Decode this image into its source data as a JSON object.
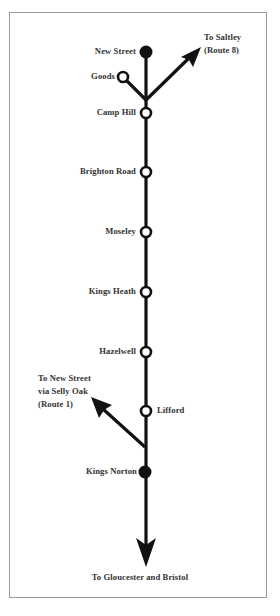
{
  "diagram": {
    "type": "railway-route-diagram",
    "line_color": "#111111",
    "frame_color": "#9a9a9a",
    "stations": [
      {
        "name": "New Street",
        "marker": "filled",
        "y": 52
      },
      {
        "name": "Goods",
        "marker": "open",
        "branch": true
      },
      {
        "name": "Camp Hill",
        "marker": "open",
        "y": 112
      },
      {
        "name": "Brighton Road",
        "marker": "open",
        "y": 172
      },
      {
        "name": "Moseley",
        "marker": "open",
        "y": 232
      },
      {
        "name": "Kings Heath",
        "marker": "open",
        "y": 292
      },
      {
        "name": "Hazelwell",
        "marker": "open",
        "y": 352
      },
      {
        "name": "Lifford",
        "marker": "open",
        "y": 411
      },
      {
        "name": "Kings Norton",
        "marker": "filled",
        "y": 472
      }
    ],
    "labels": {
      "new_street": "New Street",
      "goods": "Goods",
      "camp_hill": "Camp Hill",
      "brighton_road": "Brighton Road",
      "moseley": "Moseley",
      "kings_heath": "Kings Heath",
      "hazelwell": "Hazelwell",
      "lifford": "Lifford",
      "kings_norton": "Kings Norton"
    },
    "destinations": {
      "saltley_line1": "To Saltley",
      "saltley_line2": "(Route 8)",
      "new_street_line1": "To New Street",
      "new_street_line2": "via Selly Oak",
      "new_street_line3": "(Route 1)",
      "south": "To Gloucester and Bristol"
    }
  }
}
